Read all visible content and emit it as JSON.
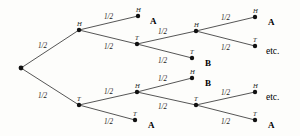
{
  "diagram": {
    "stroke_color": "#2b2b2b",
    "node_color": "#111111",
    "background_color": "#fdfdfb",
    "probability_text": "1/2"
  },
  "nodes": {
    "root": {
      "letter": "",
      "x": 21,
      "y": 68
    },
    "h": {
      "letter": "H",
      "x": 79,
      "y": 30
    },
    "t": {
      "letter": "T",
      "x": 79,
      "y": 105
    },
    "hh": {
      "letter": "H",
      "x": 138,
      "y": 16
    },
    "ht": {
      "letter": "T",
      "x": 137,
      "y": 44
    },
    "hth": {
      "letter": "H",
      "x": 196,
      "y": 31
    },
    "htt": {
      "letter": "T",
      "x": 192,
      "y": 58
    },
    "hthh": {
      "letter": "H",
      "x": 255,
      "y": 17
    },
    "htht": {
      "letter": "T",
      "x": 255,
      "y": 46
    },
    "th": {
      "letter": "H",
      "x": 137,
      "y": 92
    },
    "tt": {
      "letter": "T",
      "x": 135,
      "y": 120
    },
    "thh": {
      "letter": "H",
      "x": 192,
      "y": 78
    },
    "tht": {
      "letter": "T",
      "x": 196,
      "y": 105
    },
    "ththh": {
      "letter": "H",
      "x": 255,
      "y": 92
    },
    "ththt": {
      "letter": "T",
      "x": 255,
      "y": 120
    }
  },
  "edges": [
    {
      "id": "root-h",
      "from": "root",
      "to": "h",
      "prob": "1/2",
      "label_x": 38,
      "label_y": 43
    },
    {
      "id": "root-t",
      "from": "root",
      "to": "t",
      "prob": "1/2",
      "label_x": 38,
      "label_y": 93
    },
    {
      "id": "h-hh",
      "from": "h",
      "to": "hh",
      "prob": "1/2",
      "label_x": 104,
      "label_y": 14
    },
    {
      "id": "h-ht",
      "from": "h",
      "to": "ht",
      "prob": "1/2",
      "label_x": 104,
      "label_y": 44
    },
    {
      "id": "ht-hth",
      "from": "ht",
      "to": "hth",
      "prob": "1/2",
      "label_x": 158,
      "label_y": 29
    },
    {
      "id": "ht-htt",
      "from": "ht",
      "to": "htt",
      "prob": "1/2",
      "label_x": 158,
      "label_y": 58
    },
    {
      "id": "hth-hthh",
      "from": "hth",
      "to": "hthh",
      "prob": "1/2",
      "label_x": 221,
      "label_y": 15
    },
    {
      "id": "hth-htht",
      "from": "hth",
      "to": "htht",
      "prob": "1/2",
      "label_x": 221,
      "label_y": 45
    },
    {
      "id": "t-th",
      "from": "t",
      "to": "th",
      "prob": "1/2",
      "label_x": 104,
      "label_y": 89
    },
    {
      "id": "t-tt",
      "from": "t",
      "to": "tt",
      "prob": "1/2",
      "label_x": 104,
      "label_y": 119
    },
    {
      "id": "th-thh",
      "from": "th",
      "to": "thh",
      "prob": "1/2",
      "label_x": 158,
      "label_y": 76
    },
    {
      "id": "th-tht",
      "from": "th",
      "to": "tht",
      "prob": "1/2",
      "label_x": 158,
      "label_y": 104
    },
    {
      "id": "tht-ththh",
      "from": "tht",
      "to": "ththh",
      "prob": "1/2",
      "label_x": 221,
      "label_y": 90
    },
    {
      "id": "tht-ththt",
      "from": "tht",
      "to": "ththt",
      "prob": "1/2",
      "label_x": 221,
      "label_y": 119
    }
  ],
  "outcomes": [
    {
      "id": "outcome-hh",
      "text": "A",
      "kind": "bold",
      "x": 150,
      "y": 17
    },
    {
      "id": "outcome-htt",
      "text": "B",
      "kind": "bold",
      "x": 205,
      "y": 59
    },
    {
      "id": "outcome-hthh",
      "text": "A",
      "kind": "bold",
      "x": 268,
      "y": 18
    },
    {
      "id": "outcome-htht",
      "text": "etc.",
      "kind": "roman",
      "x": 266,
      "y": 47
    },
    {
      "id": "outcome-thh",
      "text": "B",
      "kind": "bold",
      "x": 205,
      "y": 79
    },
    {
      "id": "outcome-tt",
      "text": "A",
      "kind": "bold",
      "x": 148,
      "y": 121
    },
    {
      "id": "outcome-ththh",
      "text": "etc.",
      "kind": "roman",
      "x": 266,
      "y": 93
    },
    {
      "id": "outcome-ththt",
      "text": "A",
      "kind": "bold",
      "x": 268,
      "y": 121
    }
  ]
}
